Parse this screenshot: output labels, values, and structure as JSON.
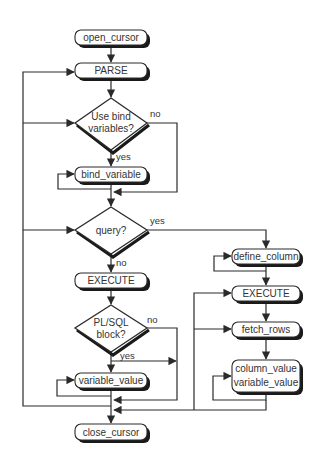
{
  "diagram": {
    "type": "flowchart",
    "nodes": {
      "open_cursor": "open_cursor",
      "parse": "PARSE",
      "use_bind_line1": "Use bind",
      "use_bind_line2": "variables?",
      "bind_variable": "bind_variable",
      "query": "query?",
      "execute_left": "EXECUTE",
      "plsql_line1": "PL/SQL",
      "plsql_line2": "block?",
      "variable_value": "variable_value",
      "close_cursor": "close_cursor",
      "define_column": "define_column",
      "execute_right": "EXECUTE",
      "fetch_rows": "fetch_rows",
      "column_value_line1": "column_value",
      "column_value_line2": "variable_value"
    },
    "edge_labels": {
      "bind_no": "no",
      "bind_yes": "yes",
      "query_yes": "yes",
      "query_no": "no",
      "plsql_no": "no",
      "plsql_yes": "yes"
    },
    "colors": {
      "line": "#2a2a2a",
      "shadow": "#1a1a1a",
      "fill": "#ffffff",
      "text": "#333333"
    }
  }
}
